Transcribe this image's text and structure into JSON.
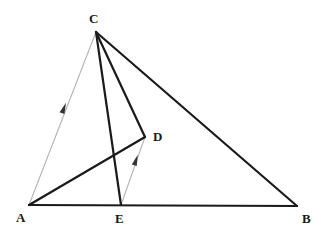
{
  "figure": {
    "type": "geometry-diagram",
    "width": 328,
    "height": 240,
    "background_color": "#ffffff"
  },
  "colors": {
    "solid_line": "#1a1a1a",
    "construction_line": "#b4b4b4",
    "arrow_mark": "#333333",
    "label_text": "#1a1a1a"
  },
  "points": {
    "A": {
      "label": "A",
      "x": 29,
      "y": 205,
      "label_x": 16,
      "label_y": 211
    },
    "B": {
      "label": "B",
      "x": 297,
      "y": 206,
      "label_x": 302,
      "label_y": 212
    },
    "C": {
      "label": "C",
      "x": 96,
      "y": 32,
      "label_x": 89,
      "label_y": 12
    },
    "D": {
      "label": "D",
      "x": 145,
      "y": 137,
      "label_x": 153,
      "label_y": 130
    },
    "E": {
      "label": "E",
      "x": 121,
      "y": 205,
      "label_x": 115,
      "label_y": 212
    }
  },
  "segments": [
    {
      "name": "segment-AB",
      "from": "A",
      "to": "B",
      "style": "solid",
      "width": 2.2
    },
    {
      "name": "segment-CB",
      "from": "C",
      "to": "B",
      "style": "solid",
      "width": 2.2
    },
    {
      "name": "segment-CE",
      "from": "C",
      "to": "E",
      "style": "solid",
      "width": 2.2
    },
    {
      "name": "segment-CD",
      "from": "C",
      "to": "D",
      "style": "solid",
      "width": 2.2
    },
    {
      "name": "segment-AD",
      "from": "A",
      "to": "D",
      "style": "solid",
      "width": 2.2
    },
    {
      "name": "segment-AC",
      "from": "A",
      "to": "C",
      "style": "construction",
      "width": 1.1
    },
    {
      "name": "segment-ED",
      "from": "E",
      "to": "D",
      "style": "construction",
      "width": 1.1
    }
  ],
  "parallel_marks": [
    {
      "name": "arrow-mark-on-AC",
      "on_segment": "segment-AC",
      "x": 64,
      "y": 108,
      "angle": -68.8
    },
    {
      "name": "arrow-mark-on-ED",
      "on_segment": "segment-ED",
      "x": 136,
      "y": 160,
      "angle": -71.7
    }
  ]
}
